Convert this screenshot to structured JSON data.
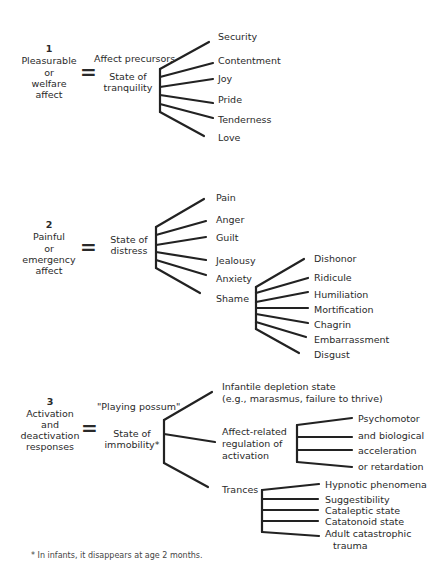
{
  "sections": [
    {
      "number": "1",
      "category": [
        "Pleasurable",
        "or",
        "welfare",
        "affect"
      ],
      "equals": "=",
      "precursor_label": "Affect precursors",
      "state": [
        "State of",
        "tranquility"
      ],
      "branches": [
        "Security",
        "Contentment",
        "Joy",
        "Pride",
        "Tenderness",
        "Love"
      ]
    },
    {
      "number": "2",
      "category": [
        "Painful",
        "or",
        "emergency",
        "affect"
      ],
      "equals": "=",
      "state": [
        "State of",
        "distress"
      ],
      "branches": [
        "Pain",
        "Anger",
        "Guilt",
        "Jealousy",
        "Anxiety",
        "Shame"
      ],
      "shame_branches": [
        "Dishonor",
        "Ridicule",
        "Humiliation",
        "Mortification",
        "Chagrin",
        "Embarrassment",
        "Disgust"
      ]
    },
    {
      "number": "3",
      "category": [
        "Activation",
        "and",
        "deactivation",
        "responses"
      ],
      "equals": "=",
      "alias": "\"Playing possum\"",
      "state": [
        "State of",
        "immobility*"
      ],
      "branches": {
        "infantile": [
          "Infantile depletion state",
          "(e.g., marasmus, failure to thrive)"
        ],
        "affect_related": [
          "Affect-related",
          "regulation of",
          "activation"
        ],
        "trances": "Trances"
      },
      "affect_related_branches": [
        "Psychomotor",
        "and biological",
        "acceleration",
        "or retardation"
      ],
      "trance_branches": [
        "Hypnotic phenomena",
        "Suggestibility",
        "Cataleptic state",
        "Catatonoid state",
        "Adult catastrophic",
        "trauma"
      ]
    }
  ],
  "footnote": "* In infants, it disappears at age 2 months."
}
